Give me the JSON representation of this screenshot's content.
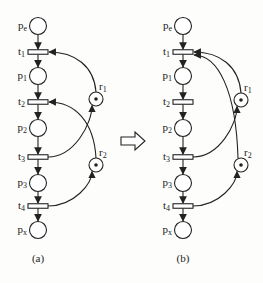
{
  "diagram": {
    "type": "petri-net-transformation",
    "colors": {
      "stroke": "#222222",
      "background": "#fdfdfb"
    },
    "transform_arrow": "⇨",
    "nets": [
      {
        "id": "a",
        "caption": "(a)",
        "places": [
          {
            "id": "pe",
            "label": "pe",
            "sub": "e"
          },
          {
            "id": "p1",
            "label": "p1",
            "sub": "1"
          },
          {
            "id": "p2",
            "label": "p2",
            "sub": "2"
          },
          {
            "id": "p3",
            "label": "p3",
            "sub": "3"
          },
          {
            "id": "px",
            "label": "px",
            "sub": "x"
          }
        ],
        "transitions": [
          {
            "id": "t1",
            "sub": "1"
          },
          {
            "id": "t2",
            "sub": "2"
          },
          {
            "id": "t3",
            "sub": "3"
          },
          {
            "id": "t4",
            "sub": "4"
          }
        ],
        "resources": [
          {
            "id": "r1",
            "sub": "1",
            "tokens": 1
          },
          {
            "id": "r2",
            "sub": "2",
            "tokens": 1
          }
        ],
        "resource_arcs": [
          {
            "from": "r1",
            "to": "t1"
          },
          {
            "from": "t3",
            "to": "r1"
          },
          {
            "from": "r2",
            "to": "t2"
          },
          {
            "from": "t4",
            "to": "r2"
          }
        ]
      },
      {
        "id": "b",
        "caption": "(b)",
        "places": [
          {
            "id": "pe",
            "label": "pe",
            "sub": "e"
          },
          {
            "id": "p1",
            "label": "p1",
            "sub": "1"
          },
          {
            "id": "p2",
            "label": "p2",
            "sub": "2"
          },
          {
            "id": "p3",
            "label": "p3",
            "sub": "3"
          },
          {
            "id": "px",
            "label": "px",
            "sub": "x"
          }
        ],
        "transitions": [
          {
            "id": "t1",
            "sub": "1"
          },
          {
            "id": "t2",
            "sub": "2"
          },
          {
            "id": "t3",
            "sub": "3"
          },
          {
            "id": "t4",
            "sub": "4"
          }
        ],
        "resources": [
          {
            "id": "r1",
            "sub": "1",
            "tokens": 1
          },
          {
            "id": "r2",
            "sub": "2",
            "tokens": 1
          }
        ],
        "resource_arcs": [
          {
            "from": "r1",
            "to": "t1"
          },
          {
            "from": "t3",
            "to": "r1"
          },
          {
            "from": "r2",
            "to": "t1"
          },
          {
            "from": "t4",
            "to": "r2"
          }
        ]
      }
    ]
  }
}
